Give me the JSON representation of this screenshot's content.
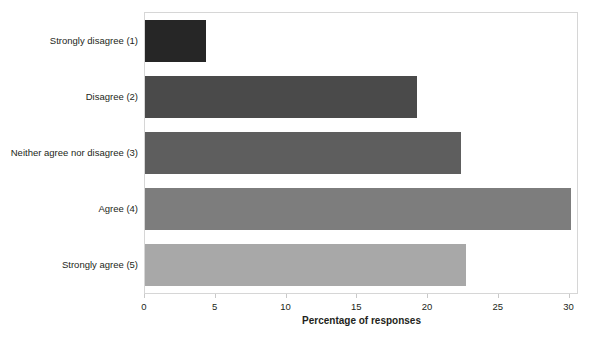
{
  "chart_data": {
    "type": "bar",
    "orientation": "horizontal",
    "title": "",
    "title_clipped": true,
    "xlabel": "Percentage of responses",
    "ylabel": "",
    "categories": [
      "Strongly disagree (1)",
      "Disagree (2)",
      "Neither agree nor disagree (3)",
      "Agree (4)",
      "Strongly agree (5)"
    ],
    "values": [
      4.3,
      19.2,
      22.3,
      30.1,
      22.7
    ],
    "bar_colors": [
      "#262626",
      "#4a4a4a",
      "#5e5e5e",
      "#7d7d7d",
      "#a8a8a8"
    ],
    "xlim": [
      0,
      30.6
    ],
    "xticks": [
      0,
      5,
      10,
      15,
      20,
      25,
      30
    ],
    "xtick_labels": [
      "0",
      "5",
      "10",
      "15",
      "20",
      "25",
      "30"
    ],
    "grid": false,
    "legend": false,
    "plot_border_color": "#d6d6d6",
    "background": "#ffffff"
  }
}
